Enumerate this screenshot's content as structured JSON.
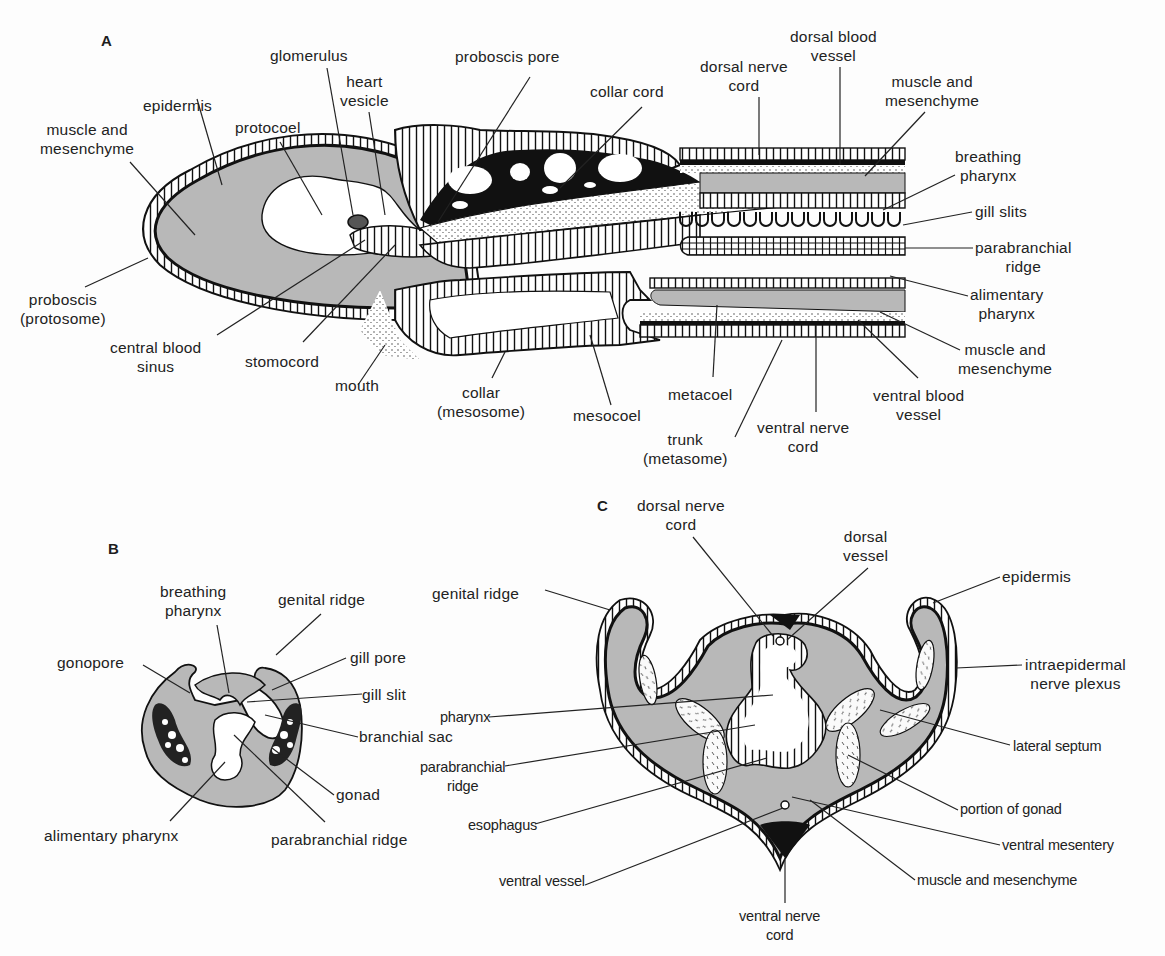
{
  "figure": {
    "panels": [
      {
        "id": "A",
        "letter": "A"
      },
      {
        "id": "B",
        "letter": "B"
      },
      {
        "id": "C",
        "letter": "C"
      }
    ],
    "colors": {
      "tissue_gray": "#b8b8b8",
      "outline": "#111111",
      "background": "#fdfdfd"
    }
  },
  "panel_a": {
    "labels": {
      "glomerulus": "glomerulus",
      "heart_vesicle": "heart\nvesicle",
      "proboscis_pore": "proboscis pore",
      "collar_cord": "collar cord",
      "dorsal_nerve_cord": "dorsal nerve\ncord",
      "dorsal_blood_vessel": "dorsal blood\nvessel",
      "muscle_mesenchyme_upper_right": "muscle and\nmesenchyme",
      "epidermis": "epidermis",
      "muscle_mesenchyme_left": "muscle and\nmesenchyme",
      "protocoel": "protocoel",
      "breathing_pharynx": "breathing\npharynx",
      "gill_slits": "gill slits",
      "parabranchial_ridge": "parabranchial\nridge",
      "alimentary_pharynx": "alimentary\npharynx",
      "muscle_mesenchyme_lower_right": "muscle and\nmesenchyme",
      "ventral_blood_vessel": "ventral blood\nvessel",
      "proboscis": "proboscis\n(protosome)",
      "central_blood_sinus": "central blood\nsinus",
      "stomocord": "stomocord",
      "mouth": "mouth",
      "collar": "collar\n(mesosome)",
      "mesocoel": "mesocoel",
      "metacoel": "metacoel",
      "trunk": "trunk\n(metasome)",
      "ventral_nerve_cord": "ventral nerve\ncord"
    }
  },
  "panel_b": {
    "labels": {
      "breathing_pharynx": "breathing\npharynx",
      "genital_ridge": "genital ridge",
      "gonopore": "gonopore",
      "gill_pore": "gill pore",
      "gill_slit": "gill slit",
      "branchial_sac": "branchial sac",
      "gonad": "gonad",
      "alimentary_pharynx": "alimentary pharynx",
      "parabranchial_ridge": "parabranchial ridge"
    }
  },
  "panel_c": {
    "labels": {
      "dorsal_nerve_cord": "dorsal nerve\ncord",
      "dorsal_vessel": "dorsal\nvessel",
      "genital_ridge": "genital ridge",
      "epidermis": "epidermis",
      "intraepidermal_nerve_plexus": "intraepidermal\nnerve plexus",
      "pharynx": "pharynx",
      "lateral_septum": "lateral septum",
      "parabranchial_ridge": "parabranchial\nridge",
      "portion_of_gonad": "portion of gonad",
      "esophagus": "esophagus",
      "ventral_mesentery": "ventral mesentery",
      "ventral_vessel": "ventral vessel",
      "muscle_mesenchyme": "muscle and mesenchyme",
      "ventral_nerve_cord": "ventral nerve\ncord"
    }
  }
}
